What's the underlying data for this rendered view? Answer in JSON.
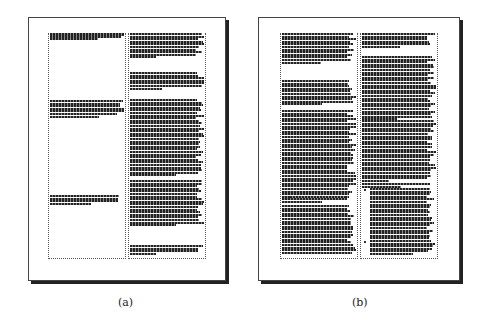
{
  "figure": {
    "panels": [
      {
        "id": "a",
        "caption": "(a)",
        "frame": {
          "x": 28,
          "y": 17,
          "w": 196,
          "h": 262
        },
        "columns": [
          {
            "x": 50,
            "y": 33,
            "w": 74,
            "h": 225,
            "blocks": [
              {
                "y": 33,
                "lines": 3,
                "last_short": true,
                "full_width": 72,
                "first_line_bold": true
              },
              {
                "y": 100,
                "lines": 7,
                "last_short": true,
                "full_width": 72
              },
              {
                "y": 195,
                "lines": 4,
                "last_short": true,
                "full_width": 72
              }
            ]
          },
          {
            "x": 130,
            "y": 33,
            "w": 74,
            "h": 225,
            "blocks": [
              {
                "y": 33,
                "lines": 10
              },
              {
                "y": 72,
                "lines": 7
              },
              {
                "y": 99,
                "lines": 30
              },
              {
                "y": 180,
                "lines": 18
              },
              {
                "y": 245,
                "lines": 4
              }
            ]
          }
        ]
      },
      {
        "id": "b",
        "caption": "(b)",
        "frame": {
          "x": 258,
          "y": 17,
          "w": 200,
          "h": 262
        },
        "columns": [
          {
            "x": 282,
            "y": 33,
            "w": 74,
            "h": 225,
            "blocks": [
              {
                "y": 33,
                "lines": 12
              },
              {
                "y": 80,
                "lines": 10
              },
              {
                "y": 110,
                "lines": 36
              },
              {
                "y": 196,
                "lines": 1,
                "heading": true
              },
              {
                "y": 205,
                "lines": 22
              }
            ]
          },
          {
            "x": 362,
            "y": 33,
            "w": 74,
            "h": 225,
            "blocks": [
              {
                "y": 33,
                "lines": 6
              },
              {
                "y": 56,
                "lines": 16
              },
              {
                "y": 95,
                "lines": 10
              },
              {
                "y": 120,
                "lines": 24
              },
              {
                "y": 183,
                "lines": 2,
                "last_short": true
              },
              {
                "y": 188,
                "lines": 22,
                "indented": true
              },
              {
                "y": 240,
                "lines": 6,
                "indented": true
              }
            ]
          }
        ]
      }
    ]
  },
  "captions": {
    "a": "(a)",
    "b": "(b)"
  }
}
